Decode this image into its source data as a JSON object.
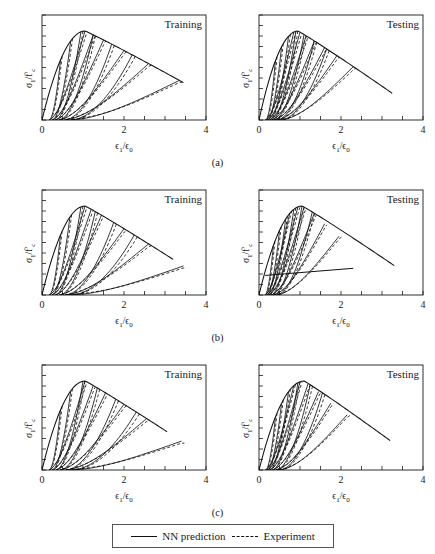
{
  "figure": {
    "row_labels": [
      "(a)",
      "(b)",
      "(c)"
    ],
    "panel_titles": {
      "left": "Training",
      "right": "Testing"
    },
    "axis": {
      "xlabel": "ϵ₁/ϵ₀",
      "ylabel": "σ₁/f'ᴄ",
      "xticks": [
        "0",
        "2",
        "4"
      ]
    },
    "legend": {
      "nn_label": "NN prediction",
      "experiment_label": "Experiment"
    }
  },
  "chart_data": {
    "type": "line",
    "xlabel": "ϵ₁/ϵ₀",
    "ylabel": "σ₁/f'ᴄ",
    "xlim": [
      0,
      4
    ],
    "ylim": [
      0,
      1.2
    ],
    "xticks": [
      0,
      2,
      4
    ],
    "xtick_labels": [
      "0",
      "2",
      "4"
    ],
    "yticks_unlabeled": 10,
    "grid": false,
    "legend_position": "bottom-center",
    "series_styles": [
      {
        "name": "NN prediction",
        "style": "solid",
        "color": "#111111"
      },
      {
        "name": "Experiment",
        "style": "dashed",
        "color": "#111111"
      }
    ],
    "panels": [
      {
        "row": "(a)",
        "column": "Training",
        "envelope": {
          "peak_x": 1.05,
          "peak_y": 1.0,
          "end_x": 3.45,
          "end_y": 0.42,
          "comment": "monotonic envelope rising to peak then softening"
        },
        "unload_reload_cycles": [
          {
            "unload_from_x": 0.45,
            "reload_to_x": 1.05,
            "peak_y": 1.0
          },
          {
            "unload_from_x": 0.7,
            "reload_to_x": 1.25,
            "peak_y": 1.0
          },
          {
            "unload_from_x": 0.95,
            "reload_to_x": 1.5,
            "peak_y": 0.99
          },
          {
            "unload_from_x": 1.25,
            "reload_to_x": 2.0,
            "peak_y": 0.83
          },
          {
            "unload_from_x": 1.7,
            "reload_to_x": 2.6,
            "peak_y": 0.68
          },
          {
            "unload_from_x": 2.2,
            "reload_to_x": 3.35,
            "peak_y": 0.55
          }
        ]
      },
      {
        "row": "(a)",
        "column": "Testing",
        "envelope": {
          "peak_x": 0.95,
          "peak_y": 1.0,
          "end_x": 3.25,
          "end_y": 0.3
        },
        "unload_reload_cycles": [
          {
            "unload_from_x": 0.4,
            "reload_to_x": 0.85,
            "peak_y": 1.0
          },
          {
            "unload_from_x": 0.55,
            "reload_to_x": 1.0,
            "peak_y": 1.0
          },
          {
            "unload_from_x": 0.72,
            "reload_to_x": 1.15,
            "peak_y": 0.98
          },
          {
            "unload_from_x": 0.9,
            "reload_to_x": 1.35,
            "peak_y": 0.93
          },
          {
            "unload_from_x": 1.1,
            "reload_to_x": 1.6,
            "peak_y": 0.86
          },
          {
            "unload_from_x": 1.35,
            "reload_to_x": 1.9,
            "peak_y": 0.77
          },
          {
            "unload_from_x": 1.65,
            "reload_to_x": 2.3,
            "peak_y": 0.62
          }
        ]
      },
      {
        "row": "(b)",
        "column": "Training",
        "envelope": {
          "peak_x": 1.05,
          "peak_y": 1.0,
          "end_x": 3.2,
          "end_y": 0.4
        },
        "unload_reload_cycles": [
          {
            "unload_from_x": 0.45,
            "reload_to_x": 1.05,
            "peak_y": 1.0
          },
          {
            "unload_from_x": 0.68,
            "reload_to_x": 1.2,
            "peak_y": 1.0
          },
          {
            "unload_from_x": 0.95,
            "reload_to_x": 1.45,
            "peak_y": 0.97
          },
          {
            "unload_from_x": 1.3,
            "reload_to_x": 2.0,
            "peak_y": 0.82
          },
          {
            "unload_from_x": 1.75,
            "reload_to_x": 2.6,
            "peak_y": 0.66
          },
          {
            "unload_from_x": 2.25,
            "reload_to_x": 3.45,
            "peak_y": 0.52
          }
        ]
      },
      {
        "row": "(b)",
        "column": "Testing",
        "envelope": {
          "peak_x": 1.05,
          "peak_y": 1.0,
          "end_x": 3.3,
          "end_y": 0.33
        },
        "unload_reload_cycles": [
          {
            "unload_from_x": 0.35,
            "reload_to_x": 0.75,
            "peak_y": 0.97
          },
          {
            "unload_from_x": 0.5,
            "reload_to_x": 0.95,
            "peak_y": 1.0
          },
          {
            "unload_from_x": 0.65,
            "reload_to_x": 1.1,
            "peak_y": 1.0
          },
          {
            "unload_from_x": 0.85,
            "reload_to_x": 1.35,
            "peak_y": 0.92
          },
          {
            "unload_from_x": 1.05,
            "reload_to_x": 1.6,
            "peak_y": 0.8
          },
          {
            "unload_from_x": 1.3,
            "reload_to_x": 1.95,
            "peak_y": 0.66
          }
        ],
        "extra_line": {
          "from_x": 0.15,
          "from_y": 0.22,
          "to_x": 2.3,
          "to_y": 0.3
        }
      },
      {
        "row": "(c)",
        "column": "Training",
        "envelope": {
          "peak_x": 1.05,
          "peak_y": 1.0,
          "end_x": 3.05,
          "end_y": 0.43
        },
        "unload_reload_cycles": [
          {
            "unload_from_x": 0.45,
            "reload_to_x": 1.05,
            "peak_y": 1.0
          },
          {
            "unload_from_x": 0.7,
            "reload_to_x": 1.25,
            "peak_y": 0.99
          },
          {
            "unload_from_x": 1.0,
            "reload_to_x": 1.55,
            "peak_y": 0.95
          },
          {
            "unload_from_x": 1.35,
            "reload_to_x": 2.0,
            "peak_y": 0.85
          },
          {
            "unload_from_x": 1.8,
            "reload_to_x": 2.55,
            "peak_y": 0.7
          },
          {
            "unload_from_x": 2.3,
            "reload_to_x": 3.4,
            "peak_y": 0.56
          }
        ]
      },
      {
        "row": "(c)",
        "column": "Testing",
        "envelope": {
          "peak_x": 1.1,
          "peak_y": 1.0,
          "end_x": 3.2,
          "end_y": 0.33
        },
        "unload_reload_cycles": [
          {
            "unload_from_x": 0.4,
            "reload_to_x": 0.85,
            "peak_y": 0.98
          },
          {
            "unload_from_x": 0.55,
            "reload_to_x": 1.0,
            "peak_y": 1.0
          },
          {
            "unload_from_x": 0.72,
            "reload_to_x": 1.2,
            "peak_y": 1.0
          },
          {
            "unload_from_x": 0.95,
            "reload_to_x": 1.45,
            "peak_y": 0.88
          },
          {
            "unload_from_x": 1.25,
            "reload_to_x": 1.75,
            "peak_y": 0.75
          },
          {
            "unload_from_x": 1.55,
            "reload_to_x": 2.15,
            "peak_y": 0.62
          }
        ]
      }
    ]
  }
}
